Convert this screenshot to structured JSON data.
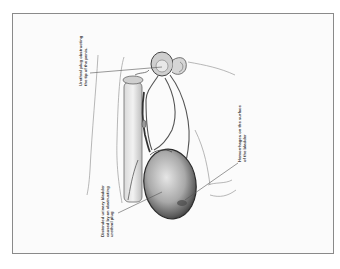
{
  "figure": {
    "type": "anatomical-illustration",
    "style": "graphite pencil drawing, rotated 90 degrees",
    "colors": {
      "ink": "#3a3a3a",
      "shade": "#6b6b6b",
      "frame": "#8a8a8a",
      "paper": "#fbfbfb"
    }
  },
  "labels": [
    {
      "id": "urethral-plug",
      "lines": [
        "Urethral plug obstructing",
        "the tip of the penis."
      ]
    },
    {
      "id": "hemorrhages",
      "lines": [
        "Hemorrhages on the surface",
        "of the bladder"
      ]
    },
    {
      "id": "distended-bladder",
      "lines": [
        "Distended urinary bladder",
        "caused by an obstructing",
        "urethral plug"
      ]
    }
  ]
}
